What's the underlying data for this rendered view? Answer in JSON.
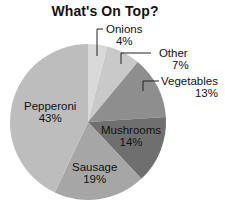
{
  "chart_data": {
    "type": "pie",
    "title": "What's On Top?",
    "categories": [
      "Onions",
      "Other",
      "Vegetables",
      "Mushrooms",
      "Sausage",
      "Pepperoni"
    ],
    "values": [
      4,
      7,
      13,
      14,
      19,
      43
    ],
    "value_labels": [
      "4%",
      "7%",
      "13%",
      "14%",
      "19%",
      "43%"
    ],
    "start_angle": "12 o'clock",
    "direction": "clockwise",
    "colors": [
      "#d9d9d9",
      "#c9c9c9",
      "#8e8e8e",
      "#6f6f6f",
      "#a6a6a6",
      "#bdbdbd"
    ],
    "legend": "none (direct labels with leader lines for Onions, Other, Vegetables)"
  },
  "labels": {
    "onions": {
      "name": "Onions",
      "pct": "4%"
    },
    "other": {
      "name": "Other",
      "pct": "7%"
    },
    "vegetables": {
      "name": "Vegetables",
      "pct": "13%"
    },
    "mushrooms": {
      "name": "Mushrooms",
      "pct": "14%"
    },
    "sausage": {
      "name": "Sausage",
      "pct": "19%"
    },
    "pepperoni": {
      "name": "Pepperoni",
      "pct": "43%"
    }
  }
}
